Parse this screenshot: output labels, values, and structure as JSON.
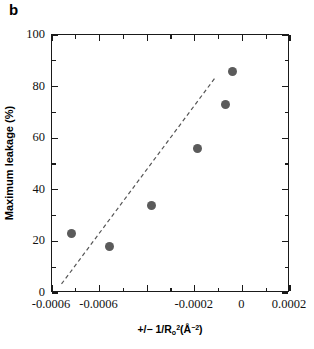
{
  "figure": {
    "panel_label": "b"
  },
  "chart_data": {
    "type": "scatter",
    "title": "",
    "xlabel": "+/− 1/Rₒ²(Å⁻²)",
    "xlabel_parts": {
      "prefix": "+/− 1/R",
      "sub": "o",
      "sup": "2",
      "unit_open": "(Å",
      "unit_sup": "−2",
      "unit_close": ")"
    },
    "ylabel": "Maximum leakage (%)",
    "xlim": [
      -0.0008,
      0.0002
    ],
    "ylim": [
      0,
      100
    ],
    "grid": false,
    "legend": "none",
    "xticks": [
      -0.0008,
      -0.0006,
      -0.0004,
      -0.0002,
      0.0,
      0.0002
    ],
    "xticklabels": [
      "-0.0006",
      "-0.0006",
      "",
      "-0.0002",
      "0",
      "0.0002"
    ],
    "xticklabels_shown": [
      {
        "value": -0.0008,
        "label": "-0.0006"
      },
      {
        "value": -0.0006,
        "label": "-0.0006"
      },
      {
        "value": -0.0002,
        "label": "-0.0002"
      },
      {
        "value": 0.0,
        "label": "0"
      },
      {
        "value": 0.0002,
        "label": "0.0002"
      }
    ],
    "x_minor_ticks": [
      -0.0007,
      -0.0005,
      -0.0004,
      -0.0003,
      -0.0001,
      0.0001
    ],
    "yticks": [
      0,
      20,
      40,
      60,
      80,
      100
    ],
    "yticklabels": [
      "0",
      "20",
      "40",
      "60",
      "80",
      "100"
    ],
    "y_minor_ticks": [
      10,
      30,
      50,
      70,
      90
    ],
    "marker_color": "#5b5b5b",
    "marker_shape": "circle",
    "points": [
      {
        "x": -0.00072,
        "y": 23
      },
      {
        "x": -0.00056,
        "y": 18
      },
      {
        "x": -0.00038,
        "y": 34
      },
      {
        "x": -0.00019,
        "y": 56
      },
      {
        "x": -7e-05,
        "y": 73
      },
      {
        "x": -4e-05,
        "y": 86
      }
    ],
    "trendline": {
      "style": "dashed",
      "color": "#555555",
      "x_start": -0.00076,
      "y_start": 3.5,
      "x_end": -0.00011,
      "y_end": 84
    }
  }
}
